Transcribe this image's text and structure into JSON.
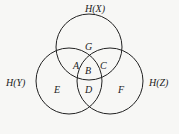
{
  "diagram": {
    "type": "venn",
    "sets": [
      {
        "id": "x",
        "label": "H(X)",
        "cx": 89,
        "cy": 47,
        "r": 33
      },
      {
        "id": "y",
        "label": "H(Y)",
        "cx": 69,
        "cy": 81,
        "r": 33
      },
      {
        "id": "z",
        "label": "H(Z)",
        "cx": 110,
        "cy": 81,
        "r": 33
      }
    ],
    "regions": {
      "G": "G",
      "A": "A",
      "B": "B",
      "C": "C",
      "D": "D",
      "E": "E",
      "F": "F"
    }
  }
}
